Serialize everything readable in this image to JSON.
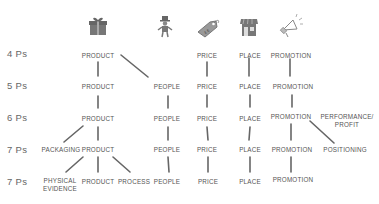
{
  "diagram": {
    "type": "marketing-mix-evolution",
    "columns": [
      {
        "key": "product",
        "icon": "gift-box-icon"
      },
      {
        "key": "people",
        "icon": "person-top-hat-icon"
      },
      {
        "key": "price",
        "icon": "price-tag-icon"
      },
      {
        "key": "place",
        "icon": "storefront-icon"
      },
      {
        "key": "promotion",
        "icon": "megaphone-icon"
      }
    ],
    "rows": [
      {
        "label": "4 Ps",
        "items": [
          "PRODUCT",
          "PRICE",
          "PLACE",
          "PROMOTION"
        ]
      },
      {
        "label": "5 Ps",
        "items": [
          "PRODUCT",
          "PEOPLE",
          "PRICE",
          "PLACE",
          "PROMOTION"
        ]
      },
      {
        "label": "6 Ps",
        "items": [
          "PRODUCT",
          "PEOPLE",
          "PRICE",
          "PLACE",
          "PROMOTION",
          "PERFORMANCE/ PROFIT"
        ]
      },
      {
        "label": "7 Ps",
        "items": [
          "PACKAGING",
          "PRODUCT",
          "PEOPLE",
          "PRICE",
          "PLACE",
          "PROMOTION",
          "POSITIONING"
        ]
      },
      {
        "label": "7 Ps",
        "items": [
          "PHYSICAL EVIDENCE",
          "PRODUCT",
          "PROCESS",
          "PEOPLE",
          "PRICE",
          "PLACE",
          "PROMOTION"
        ]
      }
    ],
    "labels": {
      "r1_product": "PRODUCT",
      "r1_price": "PRICE",
      "r1_place": "PLACE",
      "r1_promotion": "PROMOTION",
      "r2_product": "PRODUCT",
      "r2_people": "PEOPLE",
      "r2_price": "PRICE",
      "r2_place": "PLACE",
      "r2_promotion": "PROMOTION",
      "r3_product": "PRODUCT",
      "r3_people": "PEOPLE",
      "r3_price": "PRICE",
      "r3_place": "PLACE",
      "r3_promotion": "PROMOTION",
      "r3_performance_1": "PERFORMANCE/",
      "r3_performance_2": "PROFIT",
      "r4_packaging": "PACKAGING",
      "r4_product": "PRODUCT",
      "r4_people": "PEOPLE",
      "r4_price": "PRICE",
      "r4_place": "PLACE",
      "r4_promotion": "PROMOTION",
      "r4_positioning": "POSITIONING",
      "r5_physical_1": "PHYSICAL",
      "r5_physical_2": "EVIDENCE",
      "r5_product": "PRODUCT",
      "r5_process": "PROCESS",
      "r5_people": "PEOPLE",
      "r5_price": "PRICE",
      "r5_place": "PLACE",
      "r5_promotion": "PROMOTION"
    },
    "colors": {
      "text": "#555555",
      "line": "#666666",
      "icon": "#777777",
      "background": "#ffffff"
    }
  }
}
